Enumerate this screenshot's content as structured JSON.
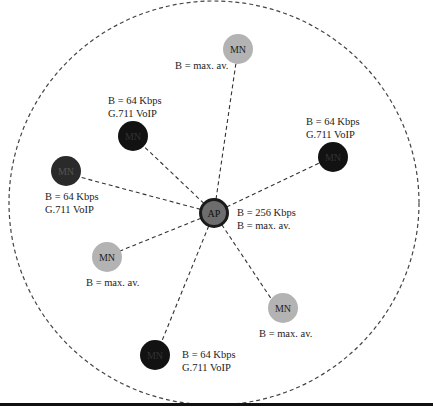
{
  "diagram": {
    "type": "wireless-network-topology",
    "colors": {
      "ap_fill": "#6d6d6d",
      "ap_stroke": "#1a1a1a",
      "voip_node_fill": "#121212",
      "best_effort_node_fill": "#b3b3b3",
      "link": "#333333",
      "range_circle": "#444444"
    },
    "access_point": {
      "label": "AP",
      "annotation_line1": "B = 256 Kbps",
      "annotation_line2": "B = max. av."
    },
    "mobile_nodes": [
      {
        "id": "mn-top",
        "label": "MN",
        "kind": "best-effort",
        "annotation_line1": "B = max. av.",
        "annotation_line2": ""
      },
      {
        "id": "mn-upper-left",
        "label": "MN",
        "kind": "voip",
        "annotation_line1": "B = 64 Kbps",
        "annotation_line2": "G.711 VoIP"
      },
      {
        "id": "mn-right",
        "label": "MN",
        "kind": "voip",
        "annotation_line1": "B = 64 Kbps",
        "annotation_line2": "G.711 VoIP"
      },
      {
        "id": "mn-left",
        "label": "MN",
        "kind": "voip",
        "annotation_line1": "B = 64 Kbps",
        "annotation_line2": "G.711 VoIP"
      },
      {
        "id": "mn-lower-left",
        "label": "MN",
        "kind": "best-effort",
        "annotation_line1": "B = max. av.",
        "annotation_line2": ""
      },
      {
        "id": "mn-lower-right",
        "label": "MN",
        "kind": "best-effort",
        "annotation_line1": "B = max. av.",
        "annotation_line2": ""
      },
      {
        "id": "mn-bottom",
        "label": "MN",
        "kind": "voip",
        "annotation_line1": "B = 64 Kbps",
        "annotation_line2": "G.711 VoIP"
      }
    ]
  }
}
